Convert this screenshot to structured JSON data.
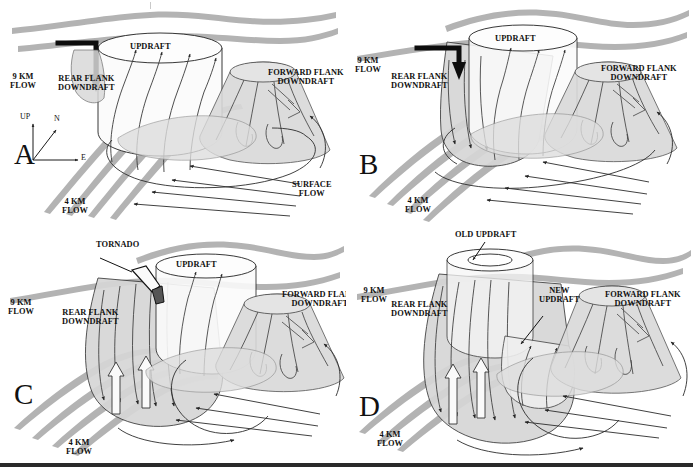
{
  "figure": {
    "type": "four-panel schematic",
    "panels": [
      "A",
      "B",
      "C",
      "D"
    ],
    "colors": {
      "flow_ribbon": "#b3b3b3",
      "cloud_fill": "#d9d9d9",
      "streamline": "#3a3a3a",
      "outline": "#222222",
      "background": "#ffffff",
      "rule": "#2a2a2a"
    }
  },
  "compass": {
    "up": "UP",
    "north": "N",
    "east": "E"
  },
  "panels": [
    {
      "letter": "A",
      "labels": {
        "updraft": "UPDRAFT",
        "rear_flank_downdraft": "REAR FLANK\nDOWNDRAFT",
        "forward_flank_downdraft": "FORWARD FLANK\nDOWNDRAFT",
        "flow_9km": "9 KM\nFLOW",
        "flow_4km": "4 KM\nFLOW",
        "surface_flow": "SURFACE\nFLOW"
      }
    },
    {
      "letter": "B",
      "labels": {
        "updraft": "UPDRAFT",
        "rear_flank_downdraft": "REAR FLANK\nDOWNDRAFT",
        "forward_flank_downdraft": "FORWARD FLANK\nDOWNDRAFT",
        "flow_9km": "9 KM\nFLOW",
        "flow_4km": "4 KM\nFLOW"
      }
    },
    {
      "letter": "C",
      "labels": {
        "tornado": "TORNADO",
        "updraft": "UPDRAFT",
        "rear_flank_downdraft": "REAR FLANK\nDOWNDRAFT",
        "forward_flank_downdraft": "FORWARD FLANK\nDOWNDRAFT",
        "flow_9km": "9 KM\nFLOW",
        "flow_4km": "4 KM\nFLOW"
      }
    },
    {
      "letter": "D",
      "labels": {
        "old_updraft": "OLD UPDRAFT",
        "new_updraft": "NEW\nUPDRAFT",
        "rear_flank_downdraft": "REAR FLANK\nDOWNDRAFT",
        "forward_flank_downdraft": "FORWARD FLANK\nDOWNDRAFT",
        "flow_9km": "9 KM\nFLOW",
        "flow_4km": "4 KM\nFLOW"
      }
    }
  ]
}
